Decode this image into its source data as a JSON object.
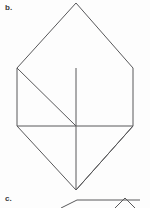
{
  "page": {
    "background_color": "#fdfdfd",
    "width": 150,
    "height": 208
  },
  "labels": {
    "item_b": "b.",
    "item_c": "c."
  },
  "style": {
    "stroke_color": "#58585a",
    "stroke_width": 1,
    "label_color": "#3a3a3a"
  },
  "figure_b": {
    "name": "tangram-hexagon-figure",
    "description": "Square with equilateral-style triangles attached top and bottom, subdivided by internal lines",
    "vertices": {
      "top_apex": [
        76,
        3
      ],
      "square_top_left": [
        17,
        68
      ],
      "square_top_right": [
        133,
        68
      ],
      "square_bottom_left": [
        17,
        126
      ],
      "square_bottom_right": [
        133,
        126
      ],
      "bottom_apex": [
        76,
        190
      ],
      "center_top": [
        76,
        68
      ],
      "center_mid": [
        76,
        126
      ]
    },
    "outline_points": "76,3 133,68 133,126 76,190 17,126 17,68",
    "internal_lines": [
      {
        "name": "vertical-center-upper",
        "points": "76,68 76,126"
      },
      {
        "name": "vertical-center-lower",
        "points": "76,126 76,190"
      },
      {
        "name": "horizontal-mid",
        "points": "17,126 133,126"
      },
      {
        "name": "diagonal-upper-left",
        "points": "17,68 76,126"
      },
      {
        "name": "diagonal-lower-right",
        "points": "76,190 133,126"
      }
    ]
  },
  "figure_c": {
    "name": "tangram-partial-figure",
    "description": "Top sliver of the next figure, cropped at the bottom edge of the screenshot",
    "outline_points": "61,208 77,200 140,200",
    "peak_points": "115,208 125,198 135,208",
    "baseline": {
      "points": "77,200 140,200"
    }
  }
}
